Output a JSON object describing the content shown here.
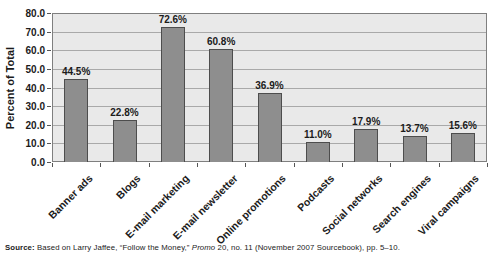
{
  "chart_data": {
    "type": "bar",
    "title": "",
    "categories": [
      "Banner ads",
      "Blogs",
      "E-mail marketing",
      "E-mail newsletter",
      "Online promotions",
      "Podcasts",
      "Social networks",
      "Search engines",
      "Viral campaigns"
    ],
    "values": [
      44.5,
      22.8,
      72.6,
      60.8,
      36.9,
      11.0,
      17.9,
      13.7,
      15.6
    ],
    "value_labels": [
      "44.5%",
      "22.8%",
      "72.6%",
      "60.8%",
      "36.9%",
      "11.0%",
      "17.9%",
      "13.7%",
      "15.6%"
    ],
    "xlabel": "",
    "ylabel": "Percent of Total",
    "ylim": [
      0,
      80
    ],
    "ytick_step": 10,
    "ytick_labels": [
      "0.0",
      "10.0",
      "20.0",
      "30.0",
      "40.0",
      "50.0",
      "60.0",
      "70.0",
      "80.0"
    ],
    "grid": true,
    "legend": "none",
    "colors": {
      "bar_fill": "#8e8e8e",
      "bar_border": "#4d4d4d",
      "plot_bg": "#e9e9e9",
      "plot_border": "#7f7f7f",
      "grid_line": "#a9a9a9",
      "axis_tick": "#555555",
      "text": "#1b1b1b"
    }
  },
  "source_note": {
    "prefix": "Source:",
    "part1": " Based on Larry Jaffee, “Follow the Money,” ",
    "italic": "Promo",
    "part2": " 20, no. 11 (November 2007 Sourcebook), pp. 5–10."
  }
}
